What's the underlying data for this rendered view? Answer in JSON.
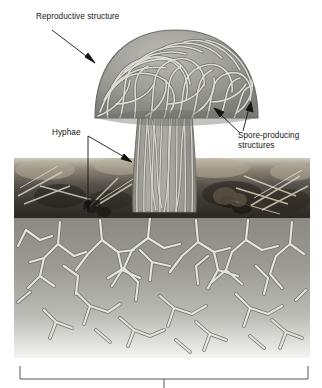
{
  "figure": {
    "kind": "biology-diagram",
    "labels": {
      "reproductive": "Reproductive structure",
      "hyphae": "Hyphae",
      "spore_line1": "Spore-producing",
      "spore_line2": "structures"
    },
    "bracket": {
      "label": "",
      "note": "bracket spanning full width at bottom with center tick; its caption is cropped off the image"
    },
    "colors": {
      "cap_fill": "#9a9a94",
      "cap_shadow": "#7e7e78",
      "hypha_light": "#d8d8d2",
      "hypha_outline": "#6f6f6a",
      "stalk_fill": "#a6a69f",
      "soil_upper": "#8d8d86",
      "soil_lower": "#a3a39c",
      "litter_dark": "#3a362f",
      "leader_line": "#1a1a1a",
      "bracket_line": "#555555",
      "text": "#141414",
      "background": "#ffffff"
    }
  },
  "regions": [
    {
      "name": "fruiting-body",
      "description": "mushroom cap of interwoven hyphae"
    },
    {
      "name": "stalk",
      "description": "vertical bundled hyphae forming the stipe"
    },
    {
      "name": "soil-photo-band",
      "description": "dark photographic leaf-litter and soil band"
    },
    {
      "name": "mycelium",
      "description": "branching underground hyphal network"
    }
  ]
}
